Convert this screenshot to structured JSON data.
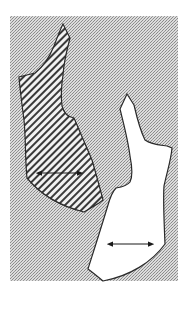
{
  "figure": {
    "background": {
      "color": "#b8b8b8",
      "pattern": "stipple"
    },
    "shapes": [
      {
        "name": "hatched-shape",
        "fill": "hatched",
        "outline_color": "#2a2a2a",
        "arrow": {
          "direction": "double-headed",
          "orientation": "horizontal"
        }
      },
      {
        "name": "white-shape",
        "fill": "#ffffff",
        "outline_color": "#2a2a2a",
        "arrow": {
          "direction": "double-headed",
          "orientation": "horizontal"
        }
      }
    ]
  }
}
